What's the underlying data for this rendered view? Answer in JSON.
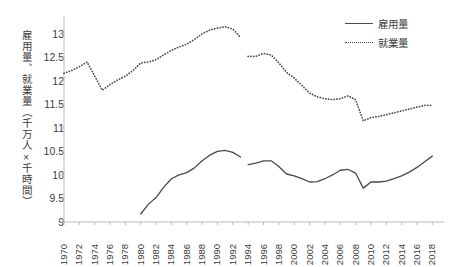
{
  "chart_data": {
    "type": "line",
    "title": "",
    "xlabel": "",
    "ylabel": "雇用量、就業量（千万人×千時間）",
    "ylim": [
      9,
      13.25
    ],
    "xlim": [
      1970,
      2019
    ],
    "yticks": [
      9,
      9.5,
      10,
      10.5,
      11,
      11.5,
      12,
      12.5,
      13
    ],
    "ytick_labels": [
      "9",
      "9.5",
      "10",
      "10.5",
      "11",
      "11.5",
      "12",
      "12.5",
      "13"
    ],
    "xticks": [
      1970,
      1972,
      1974,
      1976,
      1978,
      1980,
      1982,
      1984,
      1986,
      1988,
      1990,
      1992,
      1994,
      1996,
      1998,
      2000,
      2002,
      2004,
      2006,
      2008,
      2010,
      2012,
      2014,
      2016,
      2018
    ],
    "xtick_labels": [
      "1970",
      "1972",
      "1974",
      "1976",
      "1978",
      "1980",
      "1982",
      "1984",
      "1986",
      "1988",
      "1990",
      "1992",
      "1994",
      "1996",
      "1998",
      "2000",
      "2002",
      "2004",
      "2006",
      "2008",
      "2010",
      "2012",
      "2014",
      "2016",
      "2018"
    ],
    "grid": false,
    "legend_position": "top-right",
    "series": [
      {
        "name": "雇用量",
        "style": "solid",
        "color": "#4a4a4a",
        "segments": [
          {
            "x": [
              1980,
              1981,
              1982,
              1983,
              1984,
              1985,
              1986,
              1987,
              1988,
              1989,
              1990,
              1991,
              1992,
              1993
            ],
            "y": [
              9.17,
              9.38,
              9.52,
              9.74,
              9.92,
              10.0,
              10.05,
              10.15,
              10.3,
              10.42,
              10.5,
              10.52,
              10.48,
              10.38
            ]
          },
          {
            "x": [
              1994,
              1995,
              1996,
              1997,
              1998,
              1999,
              2000,
              2001,
              2002,
              2003,
              2004,
              2005,
              2006,
              2007,
              2008,
              2009,
              2010,
              2011,
              2012,
              2013,
              2014,
              2015,
              2016,
              2017,
              2018
            ],
            "y": [
              10.22,
              10.25,
              10.3,
              10.3,
              10.18,
              10.02,
              9.98,
              9.92,
              9.85,
              9.86,
              9.92,
              10.0,
              10.1,
              10.12,
              10.04,
              9.72,
              9.85,
              9.85,
              9.87,
              9.92,
              9.98,
              10.06,
              10.16,
              10.28,
              10.4
            ]
          }
        ]
      },
      {
        "name": "就業量",
        "style": "dotted",
        "color": "#4a4a4a",
        "segments": [
          {
            "x": [
              1970,
              1971,
              1972,
              1973,
              1974,
              1975,
              1976,
              1977,
              1978,
              1979,
              1980,
              1981,
              1982,
              1983,
              1984,
              1985,
              1986,
              1987,
              1988,
              1989,
              1990,
              1991,
              1992,
              1993
            ],
            "y": [
              12.16,
              12.22,
              12.3,
              12.4,
              12.1,
              11.8,
              11.92,
              12.02,
              12.1,
              12.22,
              12.38,
              12.4,
              12.45,
              12.55,
              12.65,
              12.72,
              12.78,
              12.88,
              13.0,
              13.08,
              13.12,
              13.15,
              13.1,
              12.92
            ]
          },
          {
            "x": [
              1994,
              1995,
              1996,
              1997,
              1998,
              1999,
              2000,
              2001,
              2002,
              2003,
              2004,
              2005,
              2006,
              2007,
              2008,
              2009,
              2010,
              2011,
              2012,
              2013,
              2014,
              2015,
              2016,
              2017,
              2018
            ],
            "y": [
              12.52,
              12.52,
              12.58,
              12.55,
              12.38,
              12.18,
              12.06,
              11.9,
              11.74,
              11.66,
              11.62,
              11.6,
              11.62,
              11.68,
              11.6,
              11.15,
              11.22,
              11.24,
              11.28,
              11.32,
              11.36,
              11.4,
              11.44,
              11.48,
              11.48
            ]
          }
        ]
      }
    ]
  },
  "legend": {
    "items": [
      {
        "label": "雇用量",
        "style": "solid"
      },
      {
        "label": "就業量",
        "style": "dotted"
      }
    ]
  },
  "axis": {
    "y_title": "雇用量、就業量（千万人×千時間）"
  }
}
